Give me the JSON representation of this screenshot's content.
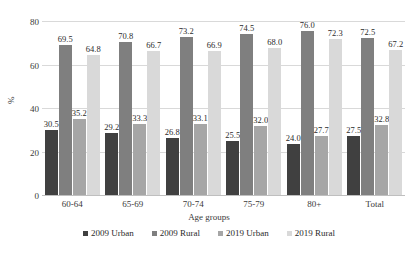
{
  "chart_data": {
    "type": "bar",
    "title": "",
    "xlabel": "Age groups",
    "ylabel": "%",
    "ylim": [
      0,
      80
    ],
    "yticks": [
      0,
      20,
      40,
      60,
      80
    ],
    "grid": true,
    "legend_position": "bottom",
    "categories": [
      "60-64",
      "65-69",
      "70-74",
      "75-79",
      "80+",
      "Total"
    ],
    "series": [
      {
        "name": "2009 Urban",
        "color": "#404040",
        "values": [
          30.5,
          29.2,
          26.8,
          25.5,
          24.0,
          27.5
        ],
        "labels": [
          "30.5",
          "29.2",
          "26.8",
          "25.5",
          "24.0",
          "27.5"
        ]
      },
      {
        "name": "2009 Rural",
        "color": "#7f7f7f",
        "values": [
          69.5,
          70.8,
          73.2,
          74.5,
          76.0,
          72.5
        ],
        "labels": [
          "69.5",
          "70.8",
          "73.2",
          "74.5",
          "76.0",
          "72.5"
        ]
      },
      {
        "name": "2019 Urban",
        "color": "#a6a6a6",
        "values": [
          35.2,
          33.3,
          33.1,
          32.0,
          27.7,
          32.8
        ],
        "labels": [
          "35.2",
          "33.3",
          "33.1",
          "32.0",
          "27.7",
          "32.8"
        ]
      },
      {
        "name": "2019 Rural",
        "color": "#d9d9d9",
        "values": [
          64.8,
          66.7,
          66.9,
          68.0,
          72.3,
          67.2
        ],
        "labels": [
          "64.8",
          "66.7",
          "66.9",
          "68.0",
          "72.3",
          "67.2"
        ]
      }
    ]
  }
}
